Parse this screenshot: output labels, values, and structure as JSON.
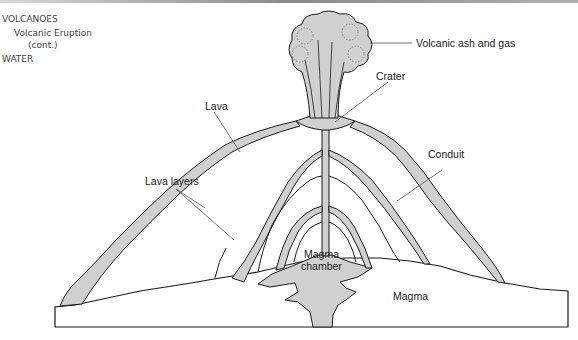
{
  "nav": {
    "section": "VOLCANOES",
    "subsection": "Volcanic Eruption",
    "subsection_note": "(cont.)",
    "next_section": "WATER"
  },
  "diagram": {
    "labels": {
      "ash": "Volcanic ash and gas",
      "crater": "Crater",
      "lava": "Lava",
      "lava_layers": "Lava layers",
      "conduit": "Conduit",
      "chamber_line1": "Magma",
      "chamber_line2": "chamber",
      "magma": "Magma"
    },
    "colors": {
      "fill": "#d0d0d0",
      "stroke": "#1a1a1a",
      "leader": "#555555"
    }
  }
}
